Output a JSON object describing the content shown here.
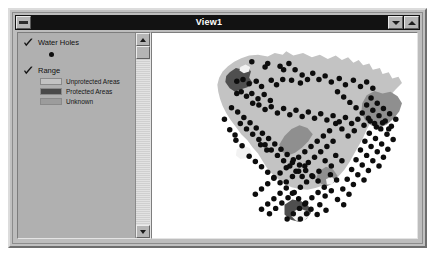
{
  "window": {
    "title": "View1",
    "system_menu_icon": "system-menu-icon",
    "minimize_icon": "minimize-icon",
    "maximize_icon": "maximize-icon"
  },
  "legend": {
    "layers": [
      {
        "name": "Water Holes",
        "checked": true,
        "symbol_type": "point",
        "symbol_color": "#0d0d0d",
        "classes": []
      },
      {
        "name": "Range",
        "checked": true,
        "symbol_type": "polygon",
        "classes": [
          {
            "label": "Unprotected Areas",
            "color": "#c3c3c3"
          },
          {
            "label": "Protected Areas",
            "color": "#4a4a4a"
          },
          {
            "label": "Unknown",
            "color": "#9c9c9c"
          }
        ]
      }
    ],
    "scrollbar": {
      "up_arrow": "scroll-up-icon",
      "down_arrow": "scroll-down-icon",
      "thumb_position_percent": 0
    }
  },
  "map": {
    "background_color": "#ffffff",
    "layers": {
      "unprotected_color": "#c3c3c3",
      "protected_color": "#8f8f8f",
      "protected_dark_color": "#4f4f4f",
      "unknown_color": "#f2f2f2",
      "waterhole_color": "#0d0d0d",
      "waterhole_radius": 3.1
    },
    "range_outline": "131,18 139,14 148,16 152,12 160,17 171,14 181,19 190,16 199,21 208,17 215,22 222,19 228,25 234,22 239,28 246,26 250,33 258,31 261,38 268,36 272,43 279,41 283,48 276,55 270,62 263,68 257,76 252,84 248,92 243,101 239,110 234,119 229,128 224,137 218,146 211,154 203,160 194,164 185,167 176,169 167,168 158,166 150,162 143,157 136,151 130,144 125,136 120,128 114,121 108,113 101,106 95,98 89,90 84,82 80,74 77,66 75,58 74,50 76,42 80,35 86,29 93,24 101,20 110,17 120,16",
    "protected_regions": [
      {
        "name": "northwest-protected",
        "points": "88,36 95,31 103,33 108,29 112,35 110,42 114,48 108,53 101,55 94,58 88,54 83,47 84,40"
      },
      {
        "name": "east-protected",
        "points": "243,62 252,57 261,60 270,58 278,63 283,71 280,80 274,88 266,95 257,99 248,96 241,90 237,81 238,71"
      },
      {
        "name": "central-band-protected",
        "points": "150,108 158,100 167,96 176,99 182,106 177,114 170,121 162,127 154,130 147,126 144,118"
      },
      {
        "name": "south-protected",
        "points": "189,148 197,143 205,146 210,153 206,161 198,165 191,162 186,155"
      },
      {
        "name": "bottom-protected",
        "points": "150,186 159,180 169,182 177,187 180,195 175,202 166,205 157,203 150,197"
      }
    ],
    "unknown_regions": [
      {
        "name": "northwest-unknown",
        "points": "100,30 106,27 111,30 110,35 104,37 99,34"
      },
      {
        "name": "west-unknown",
        "points": "96,123 104,119 111,122 113,128 108,133 100,134 95,130"
      },
      {
        "name": "bottom-unknown",
        "points": "159,194 167,190 175,193 178,199 172,204 163,204 158,199"
      },
      {
        "name": "south-small-unknown",
        "points": "197,157 203,154 207,158 204,163 198,163"
      }
    ],
    "water_holes": [
      [
        113,
        24
      ],
      [
        128,
        30
      ],
      [
        131,
        26
      ],
      [
        145,
        29
      ],
      [
        155,
        26
      ],
      [
        149,
        33
      ],
      [
        162,
        33
      ],
      [
        103,
        44
      ],
      [
        96,
        46
      ],
      [
        110,
        49
      ],
      [
        118,
        46
      ],
      [
        124,
        52
      ],
      [
        135,
        45
      ],
      [
        141,
        50
      ],
      [
        148,
        44
      ],
      [
        158,
        45
      ],
      [
        170,
        39
      ],
      [
        176,
        44
      ],
      [
        168,
        48
      ],
      [
        182,
        37
      ],
      [
        189,
        44
      ],
      [
        196,
        40
      ],
      [
        203,
        47
      ],
      [
        212,
        43
      ],
      [
        219,
        50
      ],
      [
        228,
        45
      ],
      [
        236,
        52
      ],
      [
        243,
        47
      ],
      [
        250,
        54
      ],
      [
        96,
        60
      ],
      [
        101,
        58
      ],
      [
        107,
        63
      ],
      [
        113,
        60
      ],
      [
        120,
        66
      ],
      [
        127,
        61
      ],
      [
        134,
        68
      ],
      [
        121,
        73
      ],
      [
        114,
        71
      ],
      [
        128,
        78
      ],
      [
        135,
        75
      ],
      [
        142,
        82
      ],
      [
        149,
        77
      ],
      [
        156,
        84
      ],
      [
        163,
        79
      ],
      [
        170,
        86
      ],
      [
        177,
        81
      ],
      [
        184,
        88
      ],
      [
        191,
        83
      ],
      [
        198,
        90
      ],
      [
        205,
        85
      ],
      [
        212,
        92
      ],
      [
        219,
        87
      ],
      [
        226,
        94
      ],
      [
        233,
        89
      ],
      [
        240,
        96
      ],
      [
        247,
        91
      ],
      [
        254,
        98
      ],
      [
        261,
        93
      ],
      [
        268,
        100
      ],
      [
        90,
        76
      ],
      [
        97,
        81
      ],
      [
        104,
        87
      ],
      [
        111,
        93
      ],
      [
        118,
        99
      ],
      [
        125,
        105
      ],
      [
        132,
        111
      ],
      [
        139,
        117
      ],
      [
        146,
        123
      ],
      [
        153,
        129
      ],
      [
        160,
        135
      ],
      [
        167,
        141
      ],
      [
        174,
        147
      ],
      [
        181,
        153
      ],
      [
        188,
        159
      ],
      [
        100,
        94
      ],
      [
        107,
        100
      ],
      [
        114,
        106
      ],
      [
        121,
        112
      ],
      [
        128,
        118
      ],
      [
        135,
        124
      ],
      [
        142,
        130
      ],
      [
        149,
        136
      ],
      [
        156,
        142
      ],
      [
        163,
        148
      ],
      [
        170,
        154
      ],
      [
        110,
        131
      ],
      [
        117,
        137
      ],
      [
        124,
        143
      ],
      [
        131,
        149
      ],
      [
        138,
        155
      ],
      [
        145,
        161
      ],
      [
        152,
        167
      ],
      [
        159,
        173
      ],
      [
        166,
        179
      ],
      [
        173,
        185
      ],
      [
        180,
        191
      ],
      [
        187,
        197
      ],
      [
        123,
        118
      ],
      [
        130,
        124
      ],
      [
        95,
        113
      ],
      [
        102,
        119
      ],
      [
        88,
        101
      ],
      [
        94,
        107
      ],
      [
        82,
        89
      ],
      [
        210,
        58
      ],
      [
        217,
        64
      ],
      [
        224,
        70
      ],
      [
        231,
        76
      ],
      [
        238,
        82
      ],
      [
        245,
        88
      ],
      [
        252,
        94
      ],
      [
        259,
        100
      ],
      [
        266,
        106
      ],
      [
        273,
        112
      ],
      [
        248,
        65
      ],
      [
        255,
        71
      ],
      [
        262,
        77
      ],
      [
        269,
        83
      ],
      [
        276,
        89
      ],
      [
        243,
        73
      ],
      [
        250,
        79
      ],
      [
        257,
        85
      ],
      [
        264,
        91
      ],
      [
        271,
        97
      ],
      [
        246,
        105
      ],
      [
        253,
        111
      ],
      [
        260,
        117
      ],
      [
        267,
        123
      ],
      [
        241,
        114
      ],
      [
        248,
        120
      ],
      [
        255,
        126
      ],
      [
        262,
        132
      ],
      [
        236,
        124
      ],
      [
        243,
        130
      ],
      [
        250,
        136
      ],
      [
        257,
        142
      ],
      [
        231,
        135
      ],
      [
        238,
        141
      ],
      [
        245,
        147
      ],
      [
        226,
        146
      ],
      [
        233,
        152
      ],
      [
        240,
        158
      ],
      [
        221,
        157
      ],
      [
        228,
        163
      ],
      [
        216,
        168
      ],
      [
        223,
        174
      ],
      [
        205,
        114
      ],
      [
        198,
        120
      ],
      [
        191,
        126
      ],
      [
        184,
        132
      ],
      [
        177,
        138
      ],
      [
        196,
        136
      ],
      [
        203,
        142
      ],
      [
        189,
        148
      ],
      [
        182,
        154
      ],
      [
        175,
        160
      ],
      [
        168,
        166
      ],
      [
        161,
        172
      ],
      [
        154,
        178
      ],
      [
        147,
        184
      ],
      [
        140,
        190
      ],
      [
        133,
        196
      ],
      [
        208,
        130
      ],
      [
        215,
        136
      ],
      [
        202,
        152
      ],
      [
        209,
        158
      ],
      [
        195,
        166
      ],
      [
        188,
        172
      ],
      [
        181,
        178
      ],
      [
        174,
        184
      ],
      [
        167,
        190
      ],
      [
        160,
        196
      ],
      [
        153,
        202
      ],
      [
        222,
        108
      ],
      [
        229,
        102
      ],
      [
        215,
        100
      ],
      [
        208,
        94
      ],
      [
        201,
        102
      ],
      [
        194,
        108
      ],
      [
        187,
        114
      ],
      [
        180,
        120
      ],
      [
        173,
        126
      ],
      [
        166,
        132
      ],
      [
        159,
        138
      ],
      [
        152,
        144
      ],
      [
        145,
        150
      ],
      [
        138,
        156
      ],
      [
        131,
        162
      ],
      [
        124,
        168
      ],
      [
        117,
        174
      ],
      [
        196,
        176
      ],
      [
        203,
        170
      ],
      [
        210,
        180
      ],
      [
        217,
        186
      ],
      [
        175,
        196
      ],
      [
        168,
        202
      ],
      [
        190,
        186
      ],
      [
        197,
        192
      ],
      [
        145,
        173
      ],
      [
        138,
        179
      ],
      [
        131,
        185
      ],
      [
        124,
        191
      ],
      [
        152,
        160
      ],
      [
        159,
        154
      ],
      [
        166,
        148
      ],
      [
        173,
        142
      ]
    ]
  }
}
